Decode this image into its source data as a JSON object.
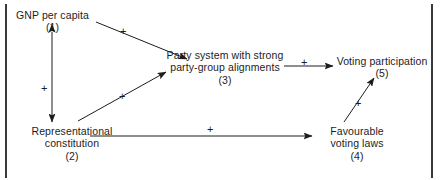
{
  "diagram": {
    "type": "causal-path-diagram",
    "frame": {
      "left_rule": "vertical-rule",
      "right_rule": "vertical-rule",
      "color": "#3a3a3a"
    },
    "nodes": [
      {
        "id": "1",
        "name": "gnp-per-capita",
        "lines": [
          "GNP per capita"
        ],
        "number": "(1)"
      },
      {
        "id": "2",
        "name": "representational-constitution",
        "lines": [
          "Representational",
          "constitution"
        ],
        "number": "(2)"
      },
      {
        "id": "3",
        "name": "party-system-alignments",
        "lines": [
          "Party system with strong",
          "party-group alignments"
        ],
        "number": "(3)"
      },
      {
        "id": "4",
        "name": "favourable-voting-laws",
        "lines": [
          "Favourable",
          "voting laws"
        ],
        "number": "(4)"
      },
      {
        "id": "5",
        "name": "voting-participation",
        "lines": [
          "Voting participation"
        ],
        "number": "(5)"
      }
    ],
    "edges": [
      {
        "from": "1",
        "to": "2",
        "sign": "+",
        "style": "double-headed-vertical"
      },
      {
        "from": "1",
        "to": "3",
        "sign": "+",
        "style": "single-headed-diagonal-down"
      },
      {
        "from": "2",
        "to": "3",
        "sign": "+",
        "style": "single-headed-diagonal-up"
      },
      {
        "from": "3",
        "to": "5",
        "sign": "+",
        "style": "single-headed-horizontal"
      },
      {
        "from": "2",
        "to": "4",
        "sign": "+",
        "style": "single-headed-horizontal"
      },
      {
        "from": "4",
        "to": "5",
        "sign": "+",
        "style": "single-headed-diagonal-up"
      }
    ]
  }
}
